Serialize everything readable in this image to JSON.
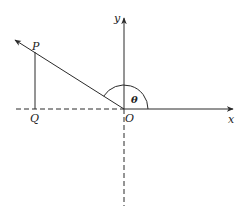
{
  "diagram": {
    "labels": {
      "x_axis": "x",
      "y_axis": "y",
      "origin": "O",
      "point_p": "P",
      "point_q": "Q",
      "angle": "θ"
    },
    "colors": {
      "stroke": "#2a2a2a",
      "background": "#ffffff"
    }
  }
}
